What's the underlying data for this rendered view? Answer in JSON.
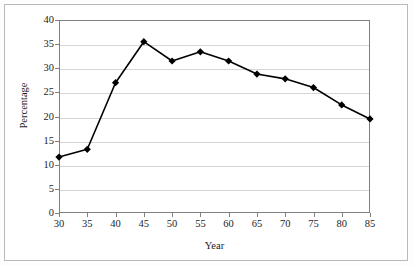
{
  "chart_data": {
    "type": "line",
    "title": "",
    "subtitle": "",
    "xlabel": "Year",
    "ylabel": "Percentage",
    "x": [
      30,
      35,
      40,
      45,
      50,
      55,
      60,
      65,
      70,
      75,
      80,
      85
    ],
    "values": [
      11.6,
      13.2,
      27.0,
      35.5,
      31.5,
      33.4,
      31.5,
      28.8,
      27.8,
      26.0,
      22.4,
      19.5
    ],
    "series": [
      {
        "name": "Percentage",
        "values": [
          11.6,
          13.2,
          27.0,
          35.5,
          31.5,
          33.4,
          31.5,
          28.8,
          27.8,
          26.0,
          22.4,
          19.5
        ]
      }
    ],
    "xlim": [
      30,
      85
    ],
    "ylim": [
      0,
      40
    ],
    "xticks": [
      30,
      35,
      40,
      45,
      50,
      55,
      60,
      65,
      70,
      75,
      80,
      85
    ],
    "yticks": [
      0,
      5,
      10,
      15,
      20,
      25,
      30,
      35,
      40
    ],
    "xtick_labels": [
      "30",
      "35",
      "40",
      "45",
      "50",
      "55",
      "60",
      "65",
      "70",
      "75",
      "80",
      "85"
    ],
    "ytick_labels": [
      "0",
      "5",
      "10",
      "15",
      "20",
      "25",
      "30",
      "35",
      "40"
    ],
    "grid": "horizontal",
    "legend": "none",
    "marker": "diamond",
    "line_color": "#000000",
    "marker_color": "#000000",
    "grid_color": "#d6d6d6",
    "axis_color": "#808080",
    "background_color": "#ffffff",
    "annotations": []
  }
}
